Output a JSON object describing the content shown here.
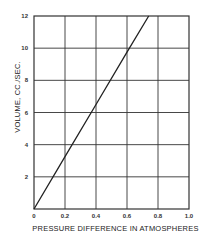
{
  "chart_data": {
    "type": "line",
    "title": "",
    "xlabel": "PRESSURE DIFFERENCE IN ATMOSPHERES",
    "ylabel": "VOLUME, CC./SEC.",
    "xlim": [
      0,
      1.0
    ],
    "ylim": [
      0,
      12
    ],
    "grid": true,
    "legend": null,
    "x_ticks": [
      "0",
      "0.2",
      "0.4",
      "0.6",
      "0.8",
      "1.0"
    ],
    "y_ticks": [
      "2",
      "4",
      "6",
      "8",
      "10",
      "12"
    ],
    "series": [
      {
        "name": "Volume vs pressure difference",
        "x": [
          0,
          0.2,
          0.4,
          0.6,
          0.74
        ],
        "y": [
          0,
          3.25,
          6.5,
          9.75,
          12
        ]
      }
    ]
  },
  "colors": {
    "line": "#222222",
    "grid": "#333333",
    "background": "#ffffff"
  }
}
